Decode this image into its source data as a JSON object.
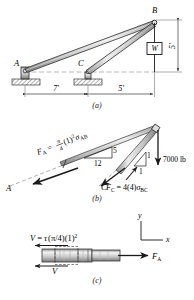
{
  "figure": {
    "captions": {
      "a": "(a)",
      "b": "(b)",
      "c": "(c)"
    }
  },
  "panel_a": {
    "points": {
      "A": "A",
      "B": "B",
      "C": "C"
    },
    "weight_box": "W",
    "dimensions": {
      "span_AC": "7'",
      "span_CD": "5'",
      "height_B": "5'"
    }
  },
  "panel_b": {
    "points": {
      "A": "A",
      "C": "C"
    },
    "force_A": {
      "symbol": "F",
      "subscript": "A",
      "equals": "=",
      "coef_num": "π",
      "coef_den": "4",
      "term": "(1)",
      "exp": "2",
      "stress": "σ",
      "stress_sub": "AB"
    },
    "force_C": {
      "symbol": "F",
      "subscript": "C",
      "equals": "=",
      "term": "4(4)",
      "stress": "σ",
      "stress_sub": "BC"
    },
    "slope_AB": {
      "run": "12",
      "rise": "5"
    },
    "slope_BC": {
      "run": "1",
      "rise": "1"
    },
    "load": "7000 lb"
  },
  "panel_c": {
    "shear": {
      "symbol": "V",
      "equals": "=",
      "tau": "τ",
      "area": "(π/4)",
      "term": "(1)",
      "exp": "2"
    },
    "shear_lower": "V",
    "force_A": {
      "symbol": "F",
      "subscript": "A"
    },
    "axes": {
      "y": "y",
      "x": "x"
    }
  },
  "colors": {
    "ink": "#1a1a1a",
    "member_light": "#e8e8e8",
    "member_mid": "#b8b8b8",
    "member_dark": "#8a8a8a",
    "ground": "#cfcfcf",
    "dash": "#8d8d8d"
  }
}
